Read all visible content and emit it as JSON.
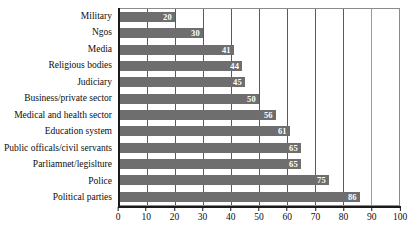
{
  "chart_data": {
    "type": "bar",
    "orientation": "horizontal",
    "title": "",
    "xlabel": "",
    "ylabel": "",
    "xlim": [
      0,
      100
    ],
    "xticks": [
      0,
      10,
      20,
      30,
      40,
      50,
      60,
      70,
      80,
      90,
      100
    ],
    "grid": true,
    "legend": "none",
    "bar_color": "#6e6e6e",
    "value_label_color": "#ffffff",
    "categories": [
      "Military",
      "Ngos",
      "Media",
      "Religious bodies",
      "Judiciary",
      "Business/private sector",
      "Medical and health sector",
      "Education system",
      "Public officals/civil servants",
      "Parliamnet/legislture",
      "Police",
      "Political parties"
    ],
    "values": [
      20,
      30,
      41,
      44,
      45,
      50,
      56,
      61,
      65,
      65,
      75,
      86
    ]
  }
}
